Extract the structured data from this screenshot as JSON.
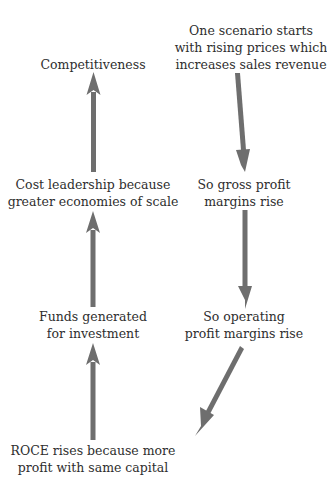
{
  "diagram": {
    "arrow_color": "#6e6e6e",
    "text_color": "#2e2e2e",
    "nodes": {
      "start": {
        "lines": [
          "One scenario starts",
          "with rising prices which",
          "increases sales revenue"
        ]
      },
      "gross": {
        "lines": [
          "So gross profit",
          "margins rise"
        ]
      },
      "operating": {
        "lines": [
          "So operating",
          "profit margins rise"
        ]
      },
      "roce": {
        "lines": [
          "ROCE rises because more",
          "profit with same capital"
        ]
      },
      "funds": {
        "lines": [
          "Funds generated",
          "for investment"
        ]
      },
      "cost": {
        "lines": [
          "Cost leadership because",
          "greater economies of scale"
        ]
      },
      "competitiveness": {
        "lines": [
          "Competitiveness"
        ]
      }
    },
    "edges": [
      {
        "from": "start",
        "to": "gross"
      },
      {
        "from": "gross",
        "to": "operating"
      },
      {
        "from": "operating",
        "to": "roce"
      },
      {
        "from": "roce",
        "to": "funds"
      },
      {
        "from": "funds",
        "to": "cost"
      },
      {
        "from": "cost",
        "to": "competitiveness"
      }
    ]
  }
}
